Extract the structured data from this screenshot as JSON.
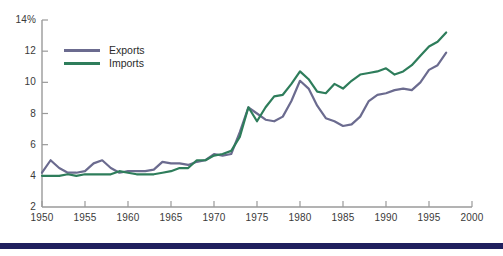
{
  "chart_data": {
    "type": "line",
    "title": "",
    "subtitle": "",
    "xlabel": "",
    "ylabel": "",
    "unit_label": "14%",
    "xlim": [
      1950,
      2000
    ],
    "ylim": [
      2,
      14
    ],
    "y_ticks": [
      2,
      4,
      6,
      8,
      10,
      12,
      14
    ],
    "y_tick_labels": [
      "2",
      "4",
      "6",
      "8",
      "10",
      "12",
      "14%"
    ],
    "x_ticks": [
      1950,
      1955,
      1960,
      1965,
      1970,
      1975,
      1980,
      1985,
      1990,
      1995,
      2000
    ],
    "x_tick_labels": [
      "1950",
      "1955",
      "1960",
      "1965",
      "1970",
      "1975",
      "1980",
      "1985",
      "1990",
      "1995",
      "2000"
    ],
    "grid": false,
    "legend_position": "upper-left",
    "x": [
      1950,
      1951,
      1952,
      1953,
      1954,
      1955,
      1956,
      1957,
      1958,
      1959,
      1960,
      1961,
      1962,
      1963,
      1964,
      1965,
      1966,
      1967,
      1968,
      1969,
      1970,
      1971,
      1972,
      1973,
      1974,
      1975,
      1976,
      1977,
      1978,
      1979,
      1980,
      1981,
      1982,
      1983,
      1984,
      1985,
      1986,
      1987,
      1988,
      1989,
      1990,
      1991,
      1992,
      1993,
      1994,
      1995,
      1996,
      1997
    ],
    "series": [
      {
        "name": "Exports",
        "color": "#6b6b8f",
        "values": [
          4.2,
          5.0,
          4.5,
          4.2,
          4.2,
          4.3,
          4.8,
          5.0,
          4.5,
          4.2,
          4.3,
          4.3,
          4.3,
          4.4,
          4.9,
          4.8,
          4.8,
          4.7,
          4.9,
          5.0,
          5.4,
          5.3,
          5.4,
          6.8,
          8.4,
          8.0,
          7.6,
          7.5,
          7.8,
          8.8,
          10.1,
          9.6,
          8.5,
          7.7,
          7.5,
          7.2,
          7.3,
          7.8,
          8.8,
          9.2,
          9.3,
          9.5,
          9.6,
          9.5,
          10.0,
          10.8,
          11.1,
          11.9
        ]
      },
      {
        "name": "Imports",
        "color": "#2e7d5b",
        "values": [
          4.0,
          4.0,
          4.0,
          4.1,
          4.0,
          4.1,
          4.1,
          4.1,
          4.1,
          4.3,
          4.2,
          4.1,
          4.1,
          4.1,
          4.2,
          4.3,
          4.5,
          4.5,
          5.0,
          5.0,
          5.3,
          5.4,
          5.6,
          6.5,
          8.4,
          7.5,
          8.4,
          9.1,
          9.2,
          9.9,
          10.7,
          10.2,
          9.4,
          9.3,
          9.9,
          9.6,
          10.1,
          10.5,
          10.6,
          10.7,
          10.9,
          10.5,
          10.7,
          11.1,
          11.7,
          12.3,
          12.6,
          13.2
        ]
      }
    ]
  },
  "legend": {
    "items": [
      {
        "label": "Exports",
        "color": "#6b6b8f"
      },
      {
        "label": "Imports",
        "color": "#2e7d5b"
      }
    ]
  },
  "decoration": {
    "bottom_rule_color": "#20205e",
    "axis_color": "#9a9a9a"
  }
}
